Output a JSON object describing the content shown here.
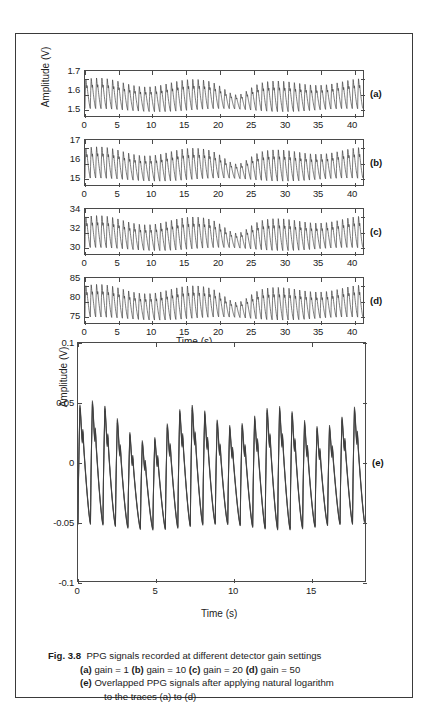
{
  "figure": {
    "caption_label": "Fig. 3.8",
    "caption_line1": "PPG signals recorded at different detector gain settings",
    "caption_line2_parts": [
      "(a)",
      " gain = 1 ",
      "(b)",
      " gain = 10 ",
      "(c)",
      " gain = 20 ",
      "(d)",
      " gain = 50"
    ],
    "caption_line3_label": "(e)",
    "caption_line3": " Overlapped PPG signals after applying natural logarithm",
    "caption_line4": "to the traces (a) to (d)"
  },
  "axes": {
    "shared_ylabel_abcd": "Amplitude (V)",
    "shared_xlabel_abcd": "Time (s)",
    "ylabel_e": "Amplitude (V)",
    "xlabel_e": "Time (s)"
  },
  "panel_labels": {
    "a": "(a)",
    "b": "(b)",
    "c": "(c)",
    "d": "(d)",
    "e": "(e)"
  },
  "chart_data": [
    {
      "type": "line",
      "id": "a",
      "title": "",
      "label": "(a)",
      "series_name": "gain = 1",
      "xlabel": "Time (s)",
      "ylabel": "Amplitude (V)",
      "xlim": [
        0,
        41.5
      ],
      "ylim": [
        1.45,
        1.74
      ],
      "xticks": [
        0,
        5,
        10,
        15,
        20,
        25,
        30,
        35,
        40
      ],
      "yticks": [
        1.5,
        1.6,
        1.7
      ],
      "xticklabels": [
        "0",
        "5",
        "10",
        "15",
        "20",
        "25",
        "30",
        "35",
        "40"
      ],
      "yticklabels": [
        "1.5",
        "1.6",
        "1.7"
      ],
      "grid": false,
      "legend": "none",
      "baseline": 1.6,
      "pulse_amplitude": 0.105,
      "pulse_rate_hz": 1.25,
      "description": "PPG waveform, detector gain 1, ~52 pulses over 41.5 s, amplitude dip near t=21-24 s"
    },
    {
      "type": "line",
      "id": "b",
      "label": "(b)",
      "series_name": "gain = 10",
      "xlabel": "Time (s)",
      "ylabel": "Amplitude (V)",
      "xlim": [
        0,
        41.5
      ],
      "ylim": [
        14.5,
        17.4
      ],
      "xticks": [
        0,
        5,
        10,
        15,
        20,
        25,
        30,
        35,
        40
      ],
      "yticks": [
        15,
        16,
        17
      ],
      "xticklabels": [
        "0",
        "5",
        "10",
        "15",
        "20",
        "25",
        "30",
        "35",
        "40"
      ],
      "yticklabels": [
        "15",
        "16",
        "17"
      ],
      "grid": false,
      "legend": "none",
      "baseline": 16.0,
      "pulse_amplitude": 1.05,
      "pulse_rate_hz": 1.25,
      "description": "PPG waveform, detector gain 10"
    },
    {
      "type": "line",
      "id": "c",
      "label": "(c)",
      "series_name": "gain = 20",
      "xlabel": "Time (s)",
      "ylabel": "Amplitude (V)",
      "xlim": [
        0,
        41.5
      ],
      "ylim": [
        28.8,
        35.0
      ],
      "xticks": [
        0,
        5,
        10,
        15,
        20,
        25,
        30,
        35,
        40
      ],
      "yticks": [
        30,
        32,
        34
      ],
      "xticklabels": [
        "0",
        "5",
        "10",
        "15",
        "20",
        "25",
        "30",
        "35",
        "40"
      ],
      "yticklabels": [
        "30",
        "32",
        "34"
      ],
      "grid": false,
      "legend": "none",
      "baseline": 32.0,
      "pulse_amplitude": 2.2,
      "pulse_rate_hz": 1.25,
      "description": "PPG waveform, detector gain 20"
    },
    {
      "type": "line",
      "id": "d",
      "label": "(d)",
      "series_name": "gain = 50",
      "xlabel": "Time (s)",
      "ylabel": "Amplitude (V)",
      "xlim": [
        0,
        41.5
      ],
      "ylim": [
        72.5,
        87.5
      ],
      "xticks": [
        0,
        5,
        10,
        15,
        20,
        25,
        30,
        35,
        40
      ],
      "yticks": [
        75,
        80,
        85
      ],
      "xticklabels": [
        "0",
        "5",
        "10",
        "15",
        "20",
        "25",
        "30",
        "35",
        "40"
      ],
      "yticklabels": [
        "75",
        "80",
        "85"
      ],
      "grid": false,
      "legend": "none",
      "baseline": 80.5,
      "pulse_amplitude": 5.4,
      "pulse_rate_hz": 1.25,
      "description": "PPG waveform, detector gain 50"
    },
    {
      "type": "line",
      "id": "e",
      "label": "(e)",
      "series_name": "Overlapped log-transformed PPG traces (a)-(d)",
      "xlabel": "Time (s)",
      "ylabel": "Amplitude (V)",
      "xlim": [
        0,
        18.5
      ],
      "ylim": [
        -0.1,
        0.1
      ],
      "xticks": [
        0,
        5,
        10,
        15
      ],
      "yticks": [
        -0.1,
        -0.05,
        0,
        0.05,
        0.1
      ],
      "xticklabels": [
        "0",
        "5",
        "10",
        "15"
      ],
      "yticklabels": [
        "-0.1",
        "-0.05",
        "0",
        "0.05",
        "0.1"
      ],
      "grid": false,
      "legend": "none",
      "baseline": 0.0,
      "peak_typical": 0.05,
      "trough_typical": -0.055,
      "pulse_rate_hz": 1.25,
      "description": "Four natural-logarithm normalised PPG traces overlapped; peaks near +0.05 V, troughs near -0.055 V over 18.5 s"
    }
  ]
}
